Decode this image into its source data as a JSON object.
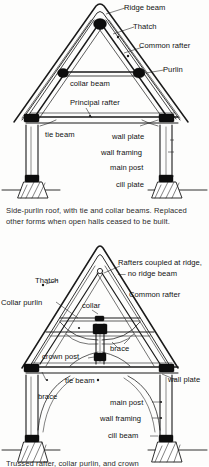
{
  "figures": [
    {
      "id": "side-purlin-roof",
      "caption": "Side-purlin roof, with tie and collar beams. Replaced other forms when open halls ceased to be built.",
      "labels": {
        "ridge_beam": "Ridge beam",
        "thatch": "Thatch",
        "common_rafter": "Common rafter",
        "purlin": "Purlin",
        "collar_beam": "collar beam",
        "principal_rafter": "Principal rafter",
        "tie_beam": "tie beam",
        "wall_plate": "wall plate",
        "wall_framing": "wall framing",
        "main_post": "main post",
        "cill_plate": "cill plate"
      }
    },
    {
      "id": "crown-post-roof",
      "caption": "Trussed rafter, collar purlin, and crown",
      "labels": {
        "rafters_coupled": "Rafters coupled at ridge, — no ridge beam",
        "common_rafter": "Common rafter",
        "thatch": "Thatch",
        "collar_purlin": "Collar purlin",
        "collar": "collar",
        "crown_post": "crown post",
        "brace_right": "brace",
        "brace_left": "brace",
        "tie_beam": "tie beam",
        "wall_plate": "wall plate",
        "main_post": "main post",
        "wall_framing": "wall framing",
        "cill_beam": "cill beam"
      }
    }
  ],
  "colors": {
    "ink": "#1a1a1a",
    "paper": "#fdfdfc",
    "joint": "#0d0d0d"
  }
}
